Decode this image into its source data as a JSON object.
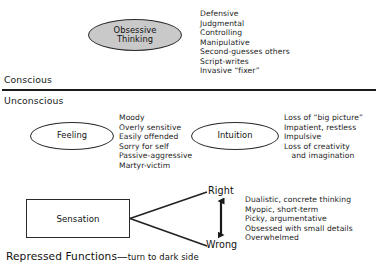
{
  "diagram": {
    "layers": {
      "conscious_label": "Conscious",
      "unconscious_label": "Unconscious"
    },
    "nodes": {
      "obsessive_thinking": "Obsessive\nThinking",
      "feeling": "Feeling",
      "intuition": "Intuition",
      "sensation": "Sensation"
    },
    "traits": {
      "obsessive_thinking": [
        "Defensive",
        "Judgmental",
        "Controlling",
        "Manipulative",
        "Second-guesses others",
        "Script-writes",
        "Invasive “fixer”"
      ],
      "feeling": [
        "Moody",
        "Overly sensitive",
        "Easily offended",
        "Sorry for self",
        "Passive-aggressive",
        "Martyr-victim"
      ],
      "intuition": [
        "Loss of “big picture”",
        "Impatient, restless",
        "Impulsive",
        "Loss of creativity",
        "   and imagination"
      ],
      "sensation": [
        "Dualistic, concrete thinking",
        "Myopic, short-term",
        "Picky, argumentative",
        "Obsessed with small details",
        "Overwhelmed"
      ]
    },
    "fork": {
      "top_label": "Right",
      "bottom_label": "Wrong"
    },
    "footer": {
      "main": "Repressed Functions",
      "dash": "—",
      "sub": "turn to dark side"
    },
    "colors": {
      "ink": "#1a1a1a",
      "stroke": "#2a2a2a",
      "shaded_fill": "#c9c9c9",
      "background": "#ffffff"
    }
  }
}
